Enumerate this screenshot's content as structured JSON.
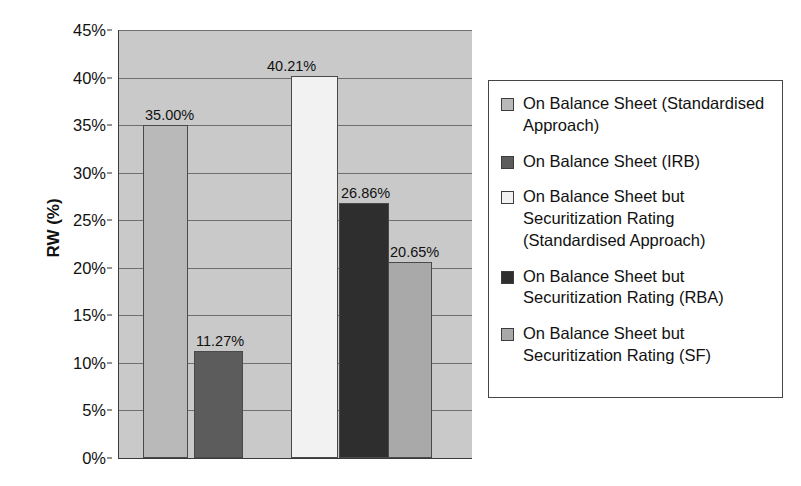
{
  "chart_data": {
    "type": "bar",
    "title": "",
    "xlabel": "",
    "ylabel": "RW (%)",
    "ylim": [
      0,
      45
    ],
    "grid": true,
    "legend_position": "right",
    "y_ticks": [
      "0%",
      "5%",
      "10%",
      "15%",
      "20%",
      "25%",
      "30%",
      "35%",
      "40%",
      "45%"
    ],
    "y_tick_values": [
      0,
      5,
      10,
      15,
      20,
      25,
      30,
      35,
      40,
      45
    ],
    "categories": [
      "On Balance Sheet (Standardised Approach)",
      "On Balance Sheet (IRB)",
      "On Balance Sheet but Securitization Rating (Standardised Approach)",
      "On Balance Sheet but Securitization Rating (RBA)",
      "On Balance Sheet but Securitization Rating (SF)"
    ],
    "values": [
      35.0,
      11.27,
      40.21,
      26.86,
      20.65
    ],
    "data_labels": [
      "35.00%",
      "11.27%",
      "40.21%",
      "26.86%",
      "20.65%"
    ],
    "colors": [
      "#b9b9b9",
      "#5c5c5c",
      "#f2f2f2",
      "#2e2e2e",
      "#a9a9a9"
    ],
    "plot_background": "#c9c9c9",
    "gridline_color": "#6f6f6f",
    "axis_color": "#3a3a3a"
  },
  "legend": {
    "items": [
      {
        "label": "On Balance Sheet (Standardised Approach)",
        "color": "#b9b9b9"
      },
      {
        "label": "On Balance Sheet (IRB)",
        "color": "#5c5c5c"
      },
      {
        "label": "On Balance Sheet but Securitization Rating (Standardised Approach)",
        "color": "#f2f2f2"
      },
      {
        "label": "On Balance Sheet but Securitization Rating (RBA)",
        "color": "#2e2e2e"
      },
      {
        "label": "On Balance Sheet but Securitization Rating (SF)",
        "color": "#a9a9a9"
      }
    ]
  }
}
